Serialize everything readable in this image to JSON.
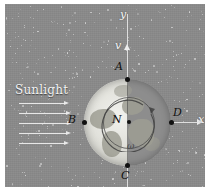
{
  "figure": {
    "background_color": "#8a8a8a",
    "border_color": "#ffffff"
  },
  "annotations": {
    "sunlight_label": "Sunlight",
    "y_axis_label": "y",
    "x_axis_label": "x",
    "velocity_label": "v",
    "angular_velocity_label": "ω",
    "center_label": "N",
    "point_a_label": "A",
    "point_b_label": "B",
    "point_c_label": "C",
    "point_d_label": "D"
  },
  "diagram_data": {
    "type": "physics-diagram",
    "globe": {
      "center_x": 122,
      "center_y": 118,
      "radius": 43,
      "lit_side": "left",
      "terminator_orientation": "vertical"
    },
    "points": [
      {
        "name": "A",
        "x": 122,
        "y": 75,
        "position": "north-pole"
      },
      {
        "name": "B",
        "x": 79,
        "y": 118,
        "position": "west-limb"
      },
      {
        "name": "C",
        "x": 122,
        "y": 161,
        "position": "south-pole"
      },
      {
        "name": "D",
        "x": 166,
        "y": 118,
        "position": "east-limb"
      },
      {
        "name": "N",
        "x": 122,
        "y": 118,
        "position": "center"
      }
    ],
    "vectors": [
      {
        "name": "v",
        "direction": "up",
        "along": "y-axis"
      },
      {
        "name": "ω",
        "direction": "counter-clockwise",
        "along": "rotation"
      }
    ],
    "sunlight_rays": {
      "count": 5,
      "direction": "left-to-right",
      "y_positions": [
        99,
        109,
        119,
        129,
        139
      ]
    },
    "axes": {
      "x": {
        "label": "x",
        "direction": "right"
      },
      "y": {
        "label": "y",
        "direction": "up"
      }
    }
  },
  "colors": {
    "space": "#8a8a8a",
    "globe_lit": "#f2f2ee",
    "globe_dark": "#9a9a9a",
    "axis": "#dedede",
    "label": "#111111",
    "ray": "#f0f0f0"
  }
}
